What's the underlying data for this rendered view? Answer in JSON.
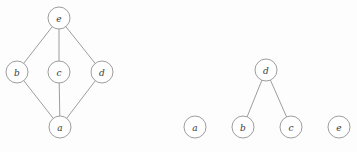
{
  "figure": {
    "width": 357,
    "height": 152,
    "background_color": "#fdfdfe",
    "node_radius": 11,
    "node_fill": "#ffffff",
    "node_stroke": "#8b8b8b",
    "edge_stroke": "#8b8b8b",
    "label_color": "#3a3a3a"
  },
  "graphs": [
    {
      "id": "left-graph",
      "name": "diamond-lattice-graph",
      "nodes": [
        {
          "id": "e",
          "label": "e",
          "cx": 59,
          "cy": 18
        },
        {
          "id": "b",
          "label": "b",
          "cx": 17,
          "cy": 72
        },
        {
          "id": "c",
          "label": "c",
          "cx": 59,
          "cy": 72
        },
        {
          "id": "d",
          "label": "d",
          "cx": 102,
          "cy": 72
        },
        {
          "id": "a",
          "label": "a",
          "cx": 60,
          "cy": 127
        }
      ],
      "edges": [
        {
          "from": "e",
          "to": "b"
        },
        {
          "from": "e",
          "to": "c"
        },
        {
          "from": "e",
          "to": "d"
        },
        {
          "from": "b",
          "to": "a"
        },
        {
          "from": "c",
          "to": "a"
        },
        {
          "from": "d",
          "to": "a"
        }
      ]
    },
    {
      "id": "right-graph",
      "name": "forest-graph",
      "nodes": [
        {
          "id": "d",
          "label": "d",
          "cx": 266,
          "cy": 70
        },
        {
          "id": "a",
          "label": "a",
          "cx": 195,
          "cy": 127
        },
        {
          "id": "b",
          "label": "b",
          "cx": 243,
          "cy": 127
        },
        {
          "id": "c",
          "label": "c",
          "cx": 291,
          "cy": 127
        },
        {
          "id": "e",
          "label": "e",
          "cx": 339,
          "cy": 127
        }
      ],
      "edges": [
        {
          "from": "d",
          "to": "b"
        },
        {
          "from": "d",
          "to": "c"
        }
      ]
    }
  ]
}
